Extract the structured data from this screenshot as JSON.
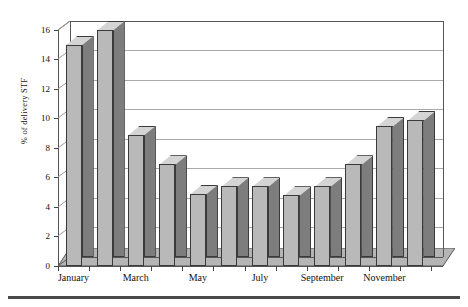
{
  "chart_data": {
    "type": "bar",
    "title": "",
    "xlabel": "",
    "ylabel": "% of delivery STF",
    "categories": [
      "January",
      "February",
      "March",
      "April",
      "May",
      "June",
      "July",
      "August",
      "September",
      "October",
      "November",
      "December"
    ],
    "values": [
      15.0,
      16.0,
      8.9,
      6.9,
      4.9,
      5.4,
      5.4,
      4.8,
      5.4,
      6.9,
      9.5,
      9.9
    ],
    "visible_tick_labels": [
      "January",
      "March",
      "May",
      "July",
      "September",
      "November"
    ],
    "ylim": [
      0,
      16
    ],
    "yticks": [
      0,
      2,
      4,
      6,
      8,
      10,
      12,
      14,
      16
    ],
    "ytick_labels": [
      "0",
      "2",
      "4",
      "6",
      "8",
      "10",
      "12",
      "14",
      "16"
    ],
    "grid": "horizontal",
    "legend": "none",
    "style": "3d-column",
    "series": [
      {
        "name": "% of delivery STF",
        "values": [
          15.0,
          16.0,
          8.9,
          6.9,
          4.9,
          5.4,
          5.4,
          4.8,
          5.4,
          6.9,
          9.5,
          9.9
        ]
      }
    ]
  },
  "colors": {
    "bar_front": "#b9b9b9",
    "bar_side": "#7d7d7d",
    "bar_top": "#d4d4d4",
    "bar_edge": "#3a3a3a",
    "gridline": "#a9a9a9",
    "axis": "#555555",
    "background": "#ffffff",
    "rule": "#4a4a4a"
  }
}
